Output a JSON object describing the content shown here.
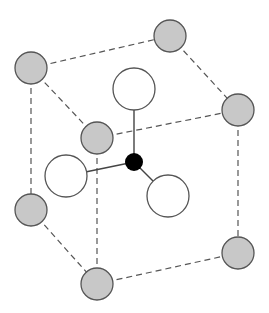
{
  "diagram": {
    "title": "",
    "colors": {
      "background": "#ffffff",
      "edge": "#555555",
      "bond": "#444444",
      "corner_fill": "#c8c8c8",
      "corner_stroke": "#555555",
      "ligand_fill": "#ffffff",
      "ligand_stroke": "#555555",
      "center_fill": "#000000"
    },
    "corner_atoms": [
      {
        "id": "top-left",
        "cx": 31,
        "cy": 68,
        "r": 16
      },
      {
        "id": "top-back",
        "cx": 170,
        "cy": 36,
        "r": 16
      },
      {
        "id": "top-right",
        "cx": 238,
        "cy": 110,
        "r": 16
      },
      {
        "id": "top-front",
        "cx": 97,
        "cy": 138,
        "r": 16
      },
      {
        "id": "bottom-left",
        "cx": 31,
        "cy": 210,
        "r": 16
      },
      {
        "id": "bottom-front",
        "cx": 97,
        "cy": 284,
        "r": 16
      },
      {
        "id": "bottom-right",
        "cx": 238,
        "cy": 253,
        "r": 16
      }
    ],
    "cube_edges": [
      {
        "from": "top-left",
        "to": "top-back"
      },
      {
        "from": "top-left",
        "to": "top-front"
      },
      {
        "from": "top-back",
        "to": "top-right"
      },
      {
        "from": "top-front",
        "to": "top-right"
      },
      {
        "from": "top-left",
        "to": "bottom-left"
      },
      {
        "from": "top-front",
        "to": "bottom-front"
      },
      {
        "from": "top-right",
        "to": "bottom-right"
      },
      {
        "from": "bottom-left",
        "to": "bottom-front"
      },
      {
        "from": "bottom-front",
        "to": "bottom-right"
      }
    ],
    "center_atom": {
      "id": "center",
      "cx": 134,
      "cy": 162,
      "r": 9
    },
    "ligand_atoms": [
      {
        "id": "ligand-top",
        "cx": 134,
        "cy": 89,
        "r": 21
      },
      {
        "id": "ligand-left",
        "cx": 66,
        "cy": 176,
        "r": 21
      },
      {
        "id": "ligand-right",
        "cx": 168,
        "cy": 196,
        "r": 21
      }
    ]
  }
}
